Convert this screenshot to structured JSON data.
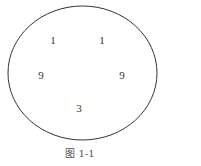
{
  "figure": {
    "caption": "图 1-1",
    "stroke_color": "#333333",
    "numbers": [
      {
        "value": "1",
        "x": 53,
        "y": 40
      },
      {
        "value": "1",
        "x": 102,
        "y": 40
      },
      {
        "value": "9",
        "x": 41,
        "y": 75
      },
      {
        "value": "9",
        "x": 122,
        "y": 75
      },
      {
        "value": "3",
        "x": 79,
        "y": 108
      }
    ]
  }
}
